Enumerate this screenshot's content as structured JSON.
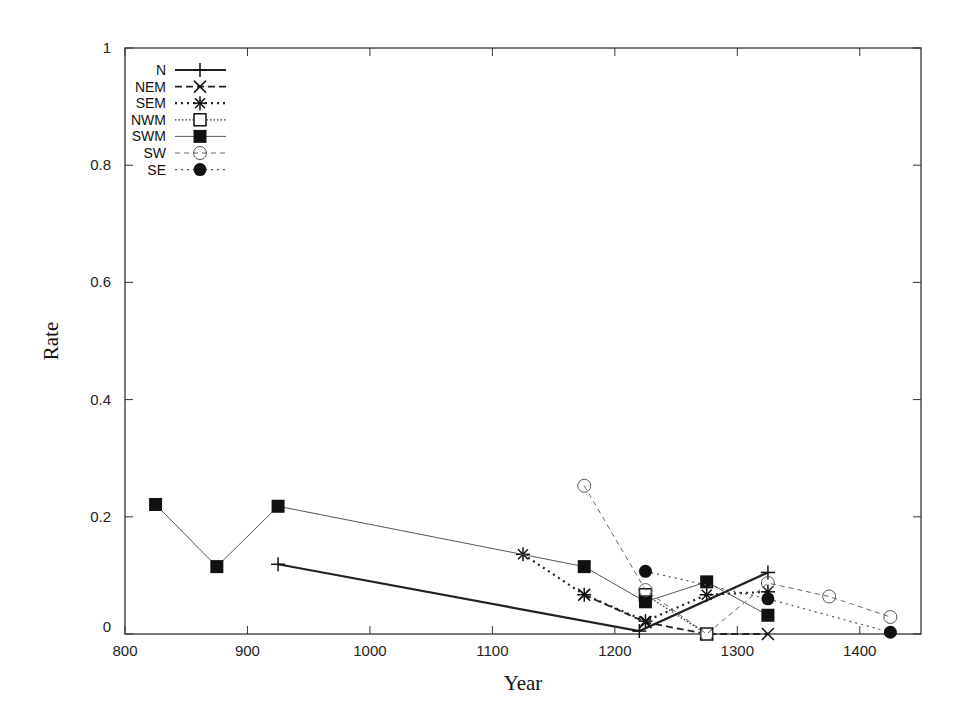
{
  "chart_data": {
    "type": "line",
    "title": "",
    "xlabel": "Year",
    "ylabel": "Rate",
    "xlim": [
      800,
      1450
    ],
    "ylim": [
      0,
      1
    ],
    "xticks": [
      800,
      900,
      1000,
      1100,
      1200,
      1300,
      1400
    ],
    "yticks": [
      0,
      0.2,
      0.4,
      0.6,
      0.8,
      1
    ],
    "xtick_labels": [
      "800",
      "900",
      "1000",
      "1100",
      "1200",
      "1300",
      "1400"
    ],
    "ytick_labels": [
      "0",
      "0.2",
      "0.4",
      "0.6",
      "0.8",
      "1"
    ],
    "grid": false,
    "legend_position": "top-left",
    "series": [
      {
        "name": "N",
        "marker": "plus",
        "line": "solid-thick",
        "x": [
          925,
          1220,
          1325
        ],
        "y": [
          0.119,
          0.005,
          0.105
        ]
      },
      {
        "name": "NEM",
        "marker": "x",
        "line": "dashed",
        "x": [
          1175,
          1225,
          1275,
          1325
        ],
        "y": [
          0.067,
          0.02,
          0.0,
          0.0
        ]
      },
      {
        "name": "SEM",
        "marker": "star",
        "line": "dotted-thick",
        "x": [
          1125,
          1175,
          1225,
          1275,
          1325
        ],
        "y": [
          0.136,
          0.067,
          0.022,
          0.067,
          0.072
        ]
      },
      {
        "name": "NWM",
        "marker": "open-square",
        "line": "dotted",
        "x": [
          1225,
          1275
        ],
        "y": [
          0.067,
          0.0
        ]
      },
      {
        "name": "SWM",
        "marker": "filled-square",
        "line": "solid-thin",
        "x": [
          825,
          875,
          925,
          1175,
          1225,
          1275,
          1325
        ],
        "y": [
          0.221,
          0.115,
          0.218,
          0.115,
          0.055,
          0.089,
          0.032
        ]
      },
      {
        "name": "SW",
        "marker": "open-circle",
        "line": "dashed-thin",
        "x": [
          1175,
          1225,
          1275,
          1325,
          1375,
          1425
        ],
        "y": [
          0.253,
          0.075,
          0.0,
          0.087,
          0.064,
          0.029
        ]
      },
      {
        "name": "SE",
        "marker": "filled-circle",
        "line": "dotted-thin",
        "x": [
          1225,
          1325,
          1425
        ],
        "y": [
          0.107,
          0.06,
          0.003
        ]
      }
    ]
  },
  "colors": {
    "axis": "#333333",
    "series": "#111111",
    "background": "#ffffff"
  }
}
